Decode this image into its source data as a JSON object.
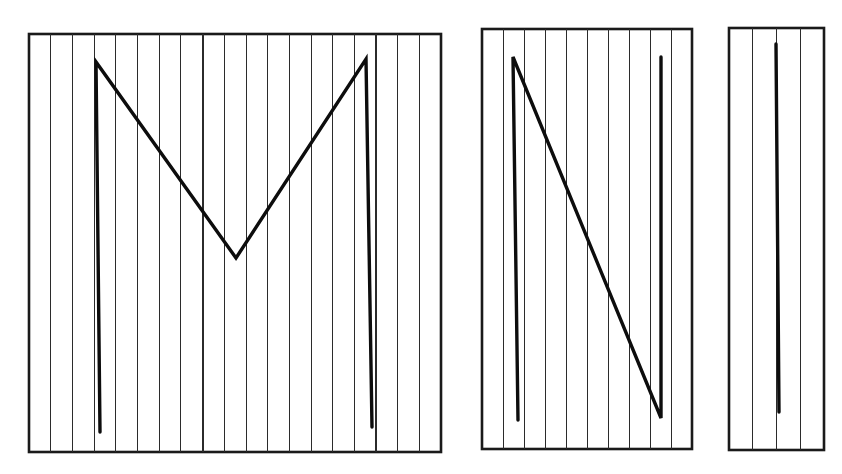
{
  "figure": {
    "background_color": "#ffffff",
    "ink_color": "#0d0d0d",
    "frame_color": "#1a1a1a",
    "ruling_color": "#2b2b2b",
    "width": 842,
    "height": 474,
    "panel_count": 3
  },
  "panels": [
    {
      "id": "panel-1",
      "name": "panel-left",
      "label": "M",
      "description": "Full letter M drawn across ruled vertical lines",
      "frame": {
        "x": 29,
        "y": 34,
        "width": 412,
        "height": 418
      },
      "frame_stroke_width": 2.6,
      "ruling": {
        "count": 18,
        "spacing": 21.7,
        "stroke_width": 1.0,
        "first_offset": 21.7,
        "emphasized_indices": [
          7,
          15
        ],
        "emphasized_stroke_width": 2.0
      },
      "strokes": [
        {
          "name": "m-letterform",
          "stroke_width": 3.4,
          "points": [
            [
              100,
              432
            ],
            [
              96,
              62
            ],
            [
              236,
              258
            ],
            [
              366,
              59
            ],
            [
              372,
              427
            ]
          ]
        }
      ]
    },
    {
      "id": "panel-2",
      "name": "panel-middle",
      "label": "N",
      "description": "Letter N formed by left vertical, diagonal and right vertical",
      "frame": {
        "x": 482,
        "y": 29,
        "width": 210,
        "height": 420
      },
      "frame_stroke_width": 2.6,
      "ruling": {
        "count": 9,
        "spacing": 21.0,
        "stroke_width": 1.0,
        "first_offset": 21.0,
        "emphasized_indices": [],
        "emphasized_stroke_width": 2.0
      },
      "strokes": [
        {
          "name": "n-letterform",
          "stroke_width": 3.4,
          "points": [
            [
              518,
              420
            ],
            [
              513,
              57
            ],
            [
              661,
              418
            ],
            [
              661,
              57
            ]
          ]
        }
      ]
    },
    {
      "id": "panel-3",
      "name": "panel-right",
      "label": "I",
      "description": "Single vertical stroke on a narrow ruled panel",
      "frame": {
        "x": 729,
        "y": 28,
        "width": 95,
        "height": 422
      },
      "frame_stroke_width": 2.6,
      "ruling": {
        "count": 3,
        "spacing": 23.7,
        "stroke_width": 1.0,
        "first_offset": 23.7,
        "emphasized_indices": [],
        "emphasized_stroke_width": 2.0
      },
      "strokes": [
        {
          "name": "i-letterform",
          "stroke_width": 3.4,
          "points": [
            [
              776,
              44
            ],
            [
              779,
              412
            ]
          ]
        }
      ]
    }
  ]
}
